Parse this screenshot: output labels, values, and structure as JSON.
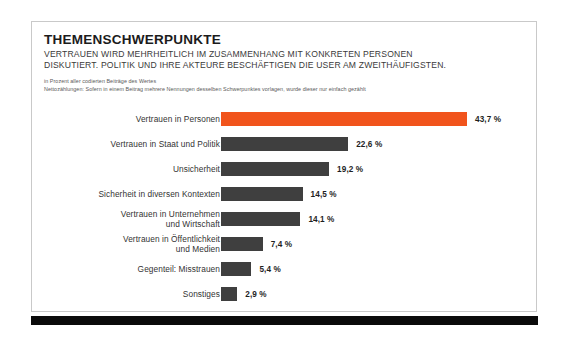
{
  "card": {
    "title": "THEMENSCHWERPUNKTE",
    "subtitle_line_1": "VERTRAUEN WIRD MEHRHEITLICH IM ZUSAMMENHANG MIT KONKRETEN PERSONEN",
    "subtitle_line_2": "DISKUTIERT. POLITIK UND IHRE AKTEURE BESCHÄFTIGEN DIE USER AM ZWEITHÄUFIGSTEN.",
    "note_line_1": "in Prozent aller codierten Beiträge des Wertes",
    "note_line_2": "Nettozählungen: Sofern in einem Beitrag mehrere Nennungen desselben Schwerpunktes vorlagen, wurde dieser nur einfach gezählt"
  },
  "colors": {
    "highlight": "#f1541c",
    "bar": "#3f3f3f",
    "rule": "#0a0a0a",
    "frame": "#c9c9c9"
  },
  "chart_data": {
    "type": "bar",
    "orientation": "horizontal",
    "title": "THEMENSCHWERPUNKTE",
    "subtitle": "VERTRAUEN WIRD MEHRHEITLICH IM ZUSAMMENHANG MIT KONKRETEN PERSONEN DISKUTIERT. POLITIK UND IHRE AKTEURE BESCHÄFTIGEN DIE USER AM ZWEITHÄUFIGSTEN.",
    "xlabel": "",
    "ylabel": "",
    "unit": "%",
    "xlim": [
      0,
      43.7
    ],
    "grid": false,
    "legend": false,
    "categories": [
      "Vertrauen in Personen",
      "Vertrauen in Staat und Politik",
      "Unsicherheit",
      "Sicherheit in diversen Kontexten",
      "Vertrauen in Unternehmen\nund Wirtschaft",
      "Vertrauen in Öffentlichkeit\nund Medien",
      "Gegenteil: Misstrauen",
      "Sonstiges"
    ],
    "values": [
      43.7,
      22.6,
      19.2,
      14.5,
      14.1,
      7.4,
      5.4,
      2.9
    ],
    "value_labels": [
      "43,7 %",
      "22,6 %",
      "19,2 %",
      "14,5 %",
      "14,1 %",
      "7,4 %",
      "5,4 %",
      "2,9 %"
    ],
    "highlight_index": 0
  }
}
